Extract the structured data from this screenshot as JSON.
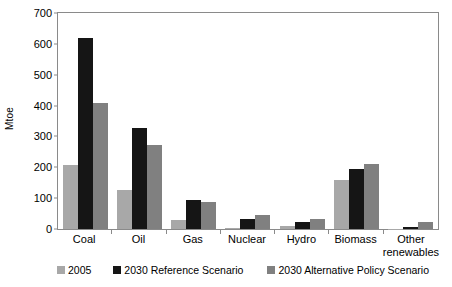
{
  "chart_data": {
    "type": "bar",
    "title": "",
    "xlabel": "",
    "ylabel": "Mtoe",
    "ylim": [
      0,
      700
    ],
    "yticks": [
      0,
      100,
      200,
      300,
      400,
      500,
      600,
      700
    ],
    "grid": false,
    "legend_position": "bottom",
    "categories": [
      "Coal",
      "Oil",
      "Gas",
      "Nuclear",
      "Hydro",
      "Biomass",
      "Other renewables"
    ],
    "series": [
      {
        "name": "2005",
        "color": "#a8a8a8",
        "values": [
          208,
          128,
          28,
          4,
          9,
          160,
          1
        ]
      },
      {
        "name": "2030 Reference Scenario",
        "color": "#151515",
        "values": [
          620,
          328,
          93,
          34,
          23,
          196,
          8
        ]
      },
      {
        "name": "2030 Alternative Policy Scenario",
        "color": "#808080",
        "values": [
          410,
          272,
          89,
          47,
          31,
          212,
          23
        ]
      }
    ]
  },
  "axis": {
    "y_title": "Mtoe",
    "ticks": {
      "t0": "0",
      "t1": "100",
      "t2": "200",
      "t3": "300",
      "t4": "400",
      "t5": "500",
      "t6": "600",
      "t7": "700"
    }
  },
  "categories": {
    "c0": "Coal",
    "c1": "Oil",
    "c2": "Gas",
    "c3": "Nuclear",
    "c4": "Hydro",
    "c5a": "Biomass",
    "c6a": "Other",
    "c6b": "renewables"
  },
  "legend": {
    "items": [
      {
        "label": "2005"
      },
      {
        "label": "2030 Reference Scenario"
      },
      {
        "label": "2030 Alternative Policy Scenario"
      }
    ]
  }
}
